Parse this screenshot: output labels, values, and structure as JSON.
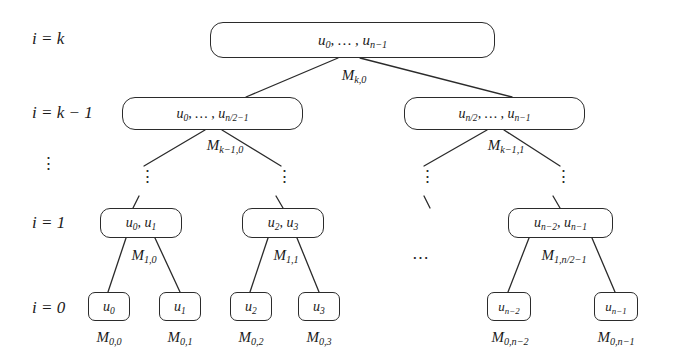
{
  "figure": {
    "type": "binary-merge-tree-diagram",
    "background_color": "#ffffff",
    "stroke_color": "#2b2b2b",
    "levels": [
      {
        "id": "level-k",
        "row_label": "i = k"
      },
      {
        "id": "level-k-1",
        "row_label": "i = k − 1"
      },
      {
        "id": "level-dots",
        "row_label": "⋮"
      },
      {
        "id": "level-1",
        "row_label": "i = 1"
      },
      {
        "id": "level-0",
        "row_label": "i = 0"
      }
    ],
    "row_labels": {
      "k": "i = k",
      "k_minus_1": "i = k − 1",
      "ellipsis": "⋮",
      "one": "i = 1",
      "zero": "i = 0"
    },
    "nodes": {
      "root": "u0, … , un−1",
      "level_k1_left": "u0, … , un/2−1",
      "level_k1_right": "un/2, … , un−1",
      "level_1_a": "u0, u1",
      "level_1_b": "u2, u3",
      "level_1_last": "un−2, un−1",
      "leaf_0": "u0",
      "leaf_1": "u1",
      "leaf_2": "u2",
      "leaf_3": "u3",
      "leaf_n2": "un−2",
      "leaf_n1": "un−1"
    },
    "edge_labels": {
      "m_k_0": "Mk,0",
      "m_k1_0": "Mk−1,0",
      "m_k1_1": "Mk−1,1",
      "m_1_0": "M1,0",
      "m_1_1": "M1,1",
      "m_1_last": "M1,n/2−1"
    },
    "leaf_labels": {
      "m_0_0": "M0,0",
      "m_0_1": "M0,1",
      "m_0_2": "M0,2",
      "m_0_3": "M0,3",
      "m_0_n2": "M0,n−2",
      "m_0_n1": "M0,n−1"
    },
    "ellipses": {
      "vertical": "⋮",
      "horizontal": "⋯"
    }
  }
}
